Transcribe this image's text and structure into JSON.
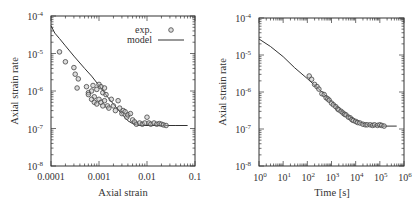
{
  "chart_data": [
    {
      "type": "scatter",
      "title": "",
      "xlabel": "Axial strain",
      "ylabel": "Axial strain rate",
      "xscale": "log",
      "yscale": "log",
      "xlim": [
        0.0001,
        0.1
      ],
      "ylim": [
        1e-08,
        0.0001
      ],
      "x_ticks": [
        "0.0001",
        "0.001",
        "0.01",
        "0.1"
      ],
      "y_ticks": [
        "10^-8",
        "10^-7",
        "10^-6",
        "10^-5",
        "10^-4"
      ],
      "legend": {
        "position": "upper right",
        "entries": [
          {
            "label": "exp.",
            "marker": "open-circle"
          },
          {
            "label": "model",
            "marker": "line"
          }
        ]
      },
      "series": [
        {
          "name": "exp.",
          "kind": "scatter",
          "x": [
            0.00015,
            0.0002,
            0.0003,
            0.00032,
            0.00037,
            0.00035,
            0.0006,
            0.00055,
            0.0007,
            0.00075,
            0.0008,
            0.0009,
            0.001,
            0.0011,
            0.0012,
            0.0013,
            0.0014,
            0.0006,
            0.0007,
            0.0008,
            0.0009,
            0.001,
            0.0011,
            0.0012,
            0.0013,
            0.0015,
            0.0016,
            0.0018,
            0.002,
            0.0022,
            0.0025,
            0.0027,
            0.003,
            0.0032,
            0.0035,
            0.0038,
            0.004,
            0.0045,
            0.005,
            0.0055,
            0.006,
            0.007,
            0.008,
            0.009,
            0.01,
            0.011,
            0.012,
            0.014,
            0.016,
            0.018,
            0.02,
            0.022,
            0.025
          ],
          "y": [
            1.1e-05,
            6e-06,
            4.2e-06,
            2.8e-06,
            2.1e-06,
            1.2e-06,
            9e-07,
            1.3e-06,
            1e-06,
            1.4e-06,
            7e-07,
            1.1e-06,
            1.5e-06,
            1.3e-06,
            9e-07,
            1.2e-06,
            8e-07,
            8e-07,
            6e-07,
            5e-07,
            4.5e-07,
            6e-07,
            5e-07,
            4e-07,
            5.5e-07,
            4e-07,
            3.5e-07,
            6e-07,
            4e-07,
            3e-07,
            5.5e-07,
            3.5e-07,
            2.5e-07,
            3e-07,
            2.8e-07,
            2e-07,
            2.3e-07,
            2.5e-07,
            1.7e-07,
            1.5e-07,
            1.3e-07,
            1.4e-07,
            1.3e-07,
            1.4e-07,
            2e-07,
            1.4e-07,
            1.3e-07,
            1.4e-07,
            1.3e-07,
            1.35e-07,
            1.3e-07,
            1.25e-07,
            1.2e-07
          ]
        },
        {
          "name": "model",
          "kind": "line",
          "x": [
            0.0001,
            0.00012,
            0.00015,
            0.0002,
            0.0003,
            0.0005,
            0.0007,
            0.001,
            0.0015,
            0.002,
            0.003,
            0.004,
            0.005,
            0.006,
            0.007,
            0.01,
            0.02,
            0.04,
            0.07
          ],
          "y": [
            5.5e-05,
            3.5e-05,
            2.5e-05,
            1.6e-05,
            8.5e-06,
            4e-06,
            2.5e-06,
            1.4e-06,
            7e-07,
            4.5e-07,
            2.4e-07,
            1.6e-07,
            1.35e-07,
            1.25e-07,
            1.2e-07,
            1.2e-07,
            1.2e-07,
            1.2e-07,
            1.2e-07
          ]
        }
      ]
    },
    {
      "type": "scatter",
      "title": "",
      "xlabel": "Time [s]",
      "ylabel": "Axial strain rate",
      "xscale": "log",
      "yscale": "log",
      "xlim": [
        1,
        1000000
      ],
      "ylim": [
        1e-08,
        0.0001
      ],
      "x_ticks": [
        "10^0",
        "10^1",
        "10^2",
        "10^3",
        "10^4",
        "10^5",
        "10^6"
      ],
      "y_ticks": [
        "10^-8",
        "10^-7",
        "10^-6",
        "10^-5",
        "10^-4"
      ],
      "series": [
        {
          "name": "exp.",
          "kind": "scatter",
          "x": [
            120,
            150,
            200,
            250,
            300,
            400,
            500,
            600,
            700,
            800,
            1000,
            1200,
            1500,
            1800,
            2000,
            2500,
            3000,
            3500,
            4000,
            5000,
            6000,
            7000,
            8000,
            10000,
            12000,
            15000,
            20000,
            25000,
            30000,
            40000,
            50000,
            60000,
            80000,
            100000,
            120000,
            150000
          ],
          "y": [
            2.7e-06,
            2.2e-06,
            1.6e-06,
            1.4e-06,
            1.2e-06,
            9e-07,
            8.5e-07,
            7e-07,
            6.5e-07,
            6e-07,
            5e-07,
            4.5e-07,
            4e-07,
            3.5e-07,
            3.3e-07,
            3e-07,
            2.7e-07,
            2.5e-07,
            2.4e-07,
            2.1e-07,
            2e-07,
            1.8e-07,
            1.7e-07,
            1.6e-07,
            1.5e-07,
            1.45e-07,
            1.35e-07,
            1.3e-07,
            1.3e-07,
            1.3e-07,
            1.25e-07,
            1.3e-07,
            1.25e-07,
            1.3e-07,
            1.25e-07,
            1.2e-07
          ]
        },
        {
          "name": "model",
          "kind": "line",
          "x": [
            1,
            3,
            10,
            30,
            100,
            300,
            1000,
            3000,
            10000,
            30000,
            100000,
            500000
          ],
          "y": [
            2.7e-05,
            1.7e-05,
            9e-06,
            4.5e-06,
            2.3e-06,
            1.2e-06,
            5.5e-07,
            2.9e-07,
            1.7e-07,
            1.3e-07,
            1.2e-07,
            1.2e-07
          ]
        }
      ]
    }
  ],
  "left_plot": {
    "xlabel": "Axial strain",
    "ylabel": "Axial strain rate",
    "legend_exp": "exp.",
    "legend_model": "model",
    "x_ticks": [
      "0.0001",
      "0.001",
      "0.01",
      "0.1"
    ],
    "y_tick_base": "10",
    "y_tick_exps": [
      "-4",
      "-5",
      "-6",
      "-7",
      "-8"
    ]
  },
  "right_plot": {
    "xlabel": "Time [s]",
    "ylabel": "Axial strain rate",
    "x_tick_base": "10",
    "x_tick_exps": [
      "0",
      "1",
      "2",
      "3",
      "4",
      "5",
      "6"
    ],
    "y_tick_base": "10",
    "y_tick_exps": [
      "-4",
      "-5",
      "-6",
      "-7",
      "-8"
    ]
  },
  "colors": {
    "axis": "#333333",
    "marker": "#555555",
    "line": "#333333",
    "background": "#ffffff"
  }
}
